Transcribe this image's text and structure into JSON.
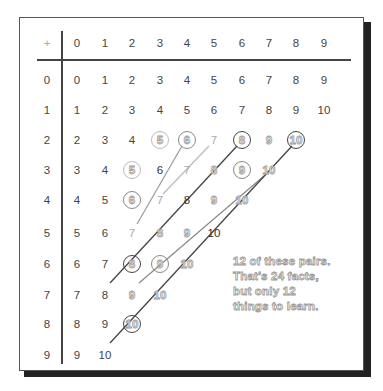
{
  "table": {
    "operator": "+",
    "column_headers": [
      "0",
      "1",
      "2",
      "3",
      "4",
      "5",
      "6",
      "7",
      "8",
      "9"
    ],
    "row_headers": [
      "0",
      "1",
      "2",
      "3",
      "4",
      "5",
      "6",
      "7",
      "8",
      "9"
    ],
    "rows": [
      [
        "0",
        "1",
        "2",
        "3",
        "4",
        "5",
        "6",
        "7",
        "8",
        "9"
      ],
      [
        "1",
        "2",
        "3",
        "4",
        "5",
        "6",
        "7",
        "8",
        "9",
        "10"
      ],
      [
        "2",
        "3",
        "4",
        "5",
        "6",
        "7",
        "8",
        "9",
        "10"
      ],
      [
        "3",
        "4",
        "5",
        "6",
        "7",
        "8",
        "9",
        "10"
      ],
      [
        "4",
        "5",
        "6",
        "7",
        "8",
        "9",
        "10"
      ],
      [
        "5",
        "6",
        "7",
        "8",
        "9",
        "10"
      ],
      [
        "6",
        "7",
        "8",
        "9",
        "10"
      ],
      [
        "7",
        "8",
        "9",
        "10"
      ],
      [
        "8",
        "9",
        "10"
      ],
      [
        "9",
        "10"
      ]
    ]
  },
  "circled_pairs": [
    {
      "value": "5",
      "from": "2+3",
      "to": "3+2",
      "tone": "light"
    },
    {
      "value": "6",
      "from": "2+4",
      "to": "4+2",
      "tone": "mid"
    },
    {
      "value": "8",
      "from": "2+6",
      "to": "6+2",
      "tone": "dark"
    },
    {
      "value": "9",
      "from": "3+6",
      "to": "6+3",
      "tone": "mid"
    },
    {
      "value": "10",
      "from": "2+8",
      "to": "8+2",
      "tone": "dark"
    }
  ],
  "note": {
    "line1": "12 of these pairs.",
    "line2": "That’s 24 facts,",
    "line3": "but only 12",
    "line4": "things to learn."
  },
  "colors": {
    "frame": "#555555",
    "shadow": "#222222",
    "text": "#444444",
    "hollow_stroke": "#999999"
  }
}
